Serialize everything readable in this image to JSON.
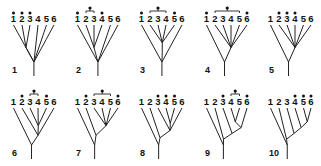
{
  "figure": {
    "taxa": [
      "1",
      "2",
      "3",
      "4",
      "5",
      "6"
    ],
    "colors": {
      "ink": "#111111",
      "background": "#ffffff"
    },
    "panels": [
      {
        "label": "1",
        "dots": [
          1,
          2,
          3
        ],
        "group_dot": null,
        "newick": "(1,(2,3),4,5,6)",
        "description": "Taxa 2 and 3 form a pair; all others join a basal polytomy"
      },
      {
        "label": "2",
        "dots": [
          1,
          4
        ],
        "group_dot": [
          2,
          3
        ],
        "newick": "(1,(2,3,4),5,6)",
        "description": "Clade (2,3,4) within basal polytomy with 1, 5, 6"
      },
      {
        "label": "3",
        "dots": [
          1,
          5
        ],
        "group_dot": [
          2,
          4
        ],
        "newick": "(1,((2,3,4,5)),6)",
        "description": "Clade (2,3,4,5) nested; 1 and 6 join at root"
      },
      {
        "label": "4",
        "dots": [
          1,
          6
        ],
        "group_dot": [
          2,
          5
        ],
        "newick": "(1,(2,3,4,5,6))",
        "description": "1 sister to clade (2-6)"
      },
      {
        "label": "5",
        "dots": [
          2,
          3,
          4
        ],
        "group_dot": null,
        "newick": "(1,(2,3,4,5,6))",
        "description": "1 sister to polytomy of 2-6"
      },
      {
        "label": "6",
        "dots": [
          2,
          5
        ],
        "group_dot": [
          3,
          4
        ],
        "newick": "(1,(2,(3,4,5),6))",
        "description": "Nested: 1 basal, then 2 and 6, clade (3,4,5)"
      },
      {
        "label": "7",
        "dots": [
          2,
          6
        ],
        "group_dot": [
          3,
          5
        ],
        "newick": "(1,(2,(3,4,5,6)))",
        "description": "Ladder: 1, 2, then clade (3,4,5,6)"
      },
      {
        "label": "8",
        "dots": [
          3,
          4,
          5
        ],
        "group_dot": null,
        "newick": "(1,(2,(3,(4,5),6)))",
        "description": "Ladder: 1, 2, then 3, (4,5), 6"
      },
      {
        "label": "9",
        "dots": [
          3,
          6
        ],
        "group_dot": [
          4,
          5
        ],
        "newick": "(1,(2,(3,((4,5),6))))",
        "description": "Ladder with (4,5) pair"
      },
      {
        "label": "10",
        "dots": [
          4,
          5,
          6
        ],
        "group_dot": null,
        "newick": "(1,(2,(3,(4,(5,6)))))",
        "description": "Fully pectinate ladder"
      }
    ]
  }
}
